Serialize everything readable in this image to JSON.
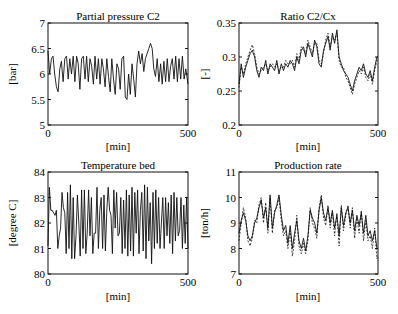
{
  "figure": {
    "width": 398,
    "height": 314,
    "line_color": "#111111",
    "background": "#ffffff"
  },
  "chart_data": [
    {
      "id": "partial-pressure",
      "type": "line",
      "title": "Partial pressure C2",
      "xlabel": "[min]",
      "ylabel": "[bar]",
      "xlim": [
        0,
        500
      ],
      "ylim": [
        5,
        7
      ],
      "xticks": [
        0,
        500
      ],
      "xtick_labels": [
        "0",
        "500"
      ],
      "yticks": [
        5,
        5.5,
        6,
        6.5,
        7
      ],
      "ytick_labels": [
        "5",
        "5.5",
        "6",
        "6.5",
        "7"
      ],
      "grid": false,
      "box": {
        "left": 48,
        "top": 23,
        "right": 188,
        "bottom": 125
      },
      "series": [
        {
          "name": "measured",
          "style": "solid",
          "x": [
            0,
            6,
            12,
            18,
            24,
            30,
            36,
            42,
            48,
            54,
            60,
            66,
            72,
            78,
            84,
            90,
            96,
            102,
            108,
            114,
            120,
            126,
            132,
            138,
            144,
            150,
            156,
            162,
            168,
            174,
            180,
            186,
            192,
            198,
            204,
            210,
            216,
            222,
            228,
            234,
            240,
            246,
            252,
            258,
            264,
            270,
            276,
            282,
            288,
            294,
            300,
            306,
            312,
            318,
            324,
            330,
            336,
            342,
            348,
            354,
            360,
            366,
            372,
            378,
            384,
            390,
            396,
            402,
            408,
            414,
            420,
            426,
            432,
            438,
            444,
            450,
            456,
            462,
            468,
            474,
            480,
            486,
            492,
            500
          ],
          "y": [
            6.45,
            6.0,
            6.3,
            6.35,
            6.0,
            5.75,
            5.65,
            6.1,
            6.25,
            5.85,
            6.3,
            6.35,
            5.9,
            6.3,
            6.0,
            6.35,
            5.85,
            6.35,
            6.2,
            5.7,
            6.3,
            6.35,
            5.9,
            6.35,
            5.85,
            6.3,
            6.15,
            5.8,
            6.35,
            5.9,
            6.3,
            5.8,
            6.3,
            6.1,
            5.75,
            6.3,
            5.95,
            5.65,
            6.3,
            5.9,
            5.6,
            6.2,
            6.1,
            5.7,
            6.3,
            6.35,
            5.55,
            5.5,
            6.0,
            5.6,
            6.2,
            5.9,
            5.55,
            6.2,
            6.45,
            6.2,
            6.4,
            6.05,
            6.3,
            6.4,
            6.5,
            6.6,
            6.5,
            6.1,
            5.95,
            6.3,
            5.85,
            6.2,
            5.8,
            6.25,
            5.85,
            6.3,
            5.85,
            6.15,
            6.3,
            5.9,
            6.35,
            5.85,
            6.3,
            5.9,
            6.35,
            5.9,
            6.1,
            5.8
          ]
        }
      ]
    },
    {
      "id": "ratio-c2-cx",
      "type": "line",
      "title": "Ratio C2/Cx",
      "xlabel": "[min]",
      "ylabel": "[-]",
      "xlim": [
        0,
        500
      ],
      "ylim": [
        0.2,
        0.35
      ],
      "xticks": [
        0,
        500
      ],
      "xtick_labels": [
        "0",
        "500"
      ],
      "yticks": [
        0.2,
        0.25,
        0.3,
        0.35
      ],
      "ytick_labels": [
        "0.2",
        "0.25",
        "0.3",
        "0.35"
      ],
      "grid": false,
      "box": {
        "left": 239,
        "top": 23,
        "right": 378,
        "bottom": 125
      },
      "series": [
        {
          "name": "measured",
          "style": "solid",
          "x": [
            0,
            8,
            16,
            24,
            32,
            40,
            48,
            56,
            64,
            72,
            80,
            88,
            96,
            104,
            112,
            120,
            128,
            136,
            144,
            152,
            160,
            168,
            176,
            184,
            192,
            200,
            208,
            216,
            224,
            232,
            240,
            248,
            256,
            264,
            272,
            280,
            288,
            296,
            304,
            312,
            320,
            328,
            336,
            344,
            352,
            360,
            368,
            376,
            384,
            392,
            400,
            408,
            416,
            424,
            432,
            440,
            448,
            456,
            464,
            472,
            480,
            488,
            496,
            500
          ],
          "y": [
            0.26,
            0.29,
            0.27,
            0.285,
            0.295,
            0.305,
            0.31,
            0.3,
            0.28,
            0.27,
            0.285,
            0.28,
            0.295,
            0.275,
            0.29,
            0.285,
            0.28,
            0.295,
            0.275,
            0.29,
            0.28,
            0.29,
            0.285,
            0.295,
            0.29,
            0.28,
            0.3,
            0.29,
            0.31,
            0.315,
            0.3,
            0.32,
            0.31,
            0.3,
            0.325,
            0.315,
            0.29,
            0.285,
            0.31,
            0.32,
            0.33,
            0.31,
            0.335,
            0.32,
            0.34,
            0.3,
            0.29,
            0.28,
            0.275,
            0.27,
            0.26,
            0.25,
            0.265,
            0.275,
            0.285,
            0.28,
            0.29,
            0.275,
            0.27,
            0.28,
            0.265,
            0.285,
            0.3,
            0.3
          ]
        },
        {
          "name": "model",
          "style": "dashed",
          "x": [
            0,
            8,
            16,
            24,
            32,
            40,
            48,
            56,
            64,
            72,
            80,
            88,
            96,
            104,
            112,
            120,
            128,
            136,
            144,
            152,
            160,
            168,
            176,
            184,
            192,
            200,
            208,
            216,
            224,
            232,
            240,
            248,
            256,
            264,
            272,
            280,
            288,
            296,
            304,
            312,
            320,
            328,
            336,
            344,
            352,
            360,
            368,
            376,
            384,
            392,
            400,
            408,
            416,
            424,
            432,
            440,
            448,
            456,
            464,
            472,
            480,
            488,
            496,
            500
          ],
          "y": [
            0.255,
            0.285,
            0.275,
            0.29,
            0.3,
            0.31,
            0.318,
            0.305,
            0.285,
            0.275,
            0.28,
            0.285,
            0.29,
            0.28,
            0.285,
            0.29,
            0.285,
            0.29,
            0.28,
            0.285,
            0.285,
            0.295,
            0.29,
            0.29,
            0.295,
            0.285,
            0.305,
            0.295,
            0.315,
            0.31,
            0.305,
            0.325,
            0.315,
            0.305,
            0.32,
            0.32,
            0.295,
            0.29,
            0.305,
            0.325,
            0.335,
            0.315,
            0.33,
            0.325,
            0.335,
            0.295,
            0.285,
            0.285,
            0.27,
            0.265,
            0.255,
            0.245,
            0.26,
            0.27,
            0.28,
            0.275,
            0.285,
            0.27,
            0.265,
            0.275,
            0.26,
            0.28,
            0.295,
            0.295
          ]
        }
      ]
    },
    {
      "id": "temperature-bed",
      "type": "line",
      "title": "Temperature bed",
      "xlabel": "[min]",
      "ylabel": "[degree C]",
      "xlim": [
        0,
        500
      ],
      "ylim": [
        80,
        84
      ],
      "xticks": [
        0,
        500
      ],
      "xtick_labels": [
        "0",
        "500"
      ],
      "yticks": [
        80,
        81,
        82,
        83,
        84
      ],
      "ytick_labels": [
        "80",
        "81",
        "82",
        "83",
        "84"
      ],
      "grid": false,
      "box": {
        "left": 48,
        "top": 172,
        "right": 188,
        "bottom": 274
      },
      "series": [
        {
          "name": "measured",
          "style": "solid",
          "x": [
            0,
            5,
            10,
            15,
            20,
            25,
            30,
            35,
            40,
            45,
            50,
            55,
            60,
            65,
            70,
            75,
            80,
            85,
            90,
            95,
            100,
            105,
            110,
            115,
            120,
            125,
            130,
            135,
            140,
            145,
            150,
            155,
            160,
            165,
            170,
            175,
            180,
            185,
            190,
            195,
            200,
            205,
            210,
            215,
            220,
            225,
            230,
            235,
            240,
            245,
            250,
            255,
            260,
            265,
            270,
            275,
            280,
            285,
            290,
            295,
            300,
            305,
            310,
            315,
            320,
            325,
            330,
            335,
            340,
            345,
            350,
            355,
            360,
            365,
            370,
            375,
            380,
            385,
            390,
            395,
            400,
            405,
            410,
            415,
            420,
            425,
            430,
            435,
            440,
            445,
            450,
            455,
            460,
            465,
            470,
            475,
            480,
            485,
            490,
            495,
            500
          ],
          "y": [
            81.1,
            83.4,
            82.5,
            82.5,
            82.4,
            82.3,
            82.5,
            81.0,
            81.5,
            81.8,
            83.2,
            82.6,
            82.4,
            80.8,
            83.2,
            81.0,
            83.5,
            80.6,
            83.0,
            80.6,
            81.5,
            83.1,
            82.0,
            80.7,
            83.3,
            81.0,
            83.3,
            80.8,
            81.6,
            83.3,
            81.5,
            83.0,
            80.8,
            81.6,
            81.6,
            83.4,
            81.0,
            82.5,
            83.0,
            81.0,
            83.1,
            80.9,
            82.5,
            83.4,
            82.5,
            82.3,
            80.8,
            83.3,
            81.8,
            83.2,
            81.5,
            81.6,
            83.0,
            80.8,
            82.9,
            81.0,
            83.3,
            80.7,
            83.1,
            80.9,
            83.4,
            80.7,
            83.2,
            81.6,
            83.3,
            80.8,
            82.5,
            83.2,
            80.9,
            83.5,
            80.6,
            83.4,
            81.3,
            82.8,
            80.4,
            83.2,
            81.0,
            83.3,
            81.2,
            83.0,
            81.0,
            82.0,
            83.0,
            81.0,
            83.0,
            81.5,
            82.8,
            81.2,
            83.1,
            80.8,
            83.2,
            81.3,
            83.0,
            81.5,
            81.7,
            83.0,
            81.0,
            82.7,
            81.2,
            83.0,
            81.0
          ]
        }
      ]
    },
    {
      "id": "production-rate",
      "type": "line",
      "title": "Production rate",
      "xlabel": "[min]",
      "ylabel": "[ton/h]",
      "xlim": [
        0,
        500
      ],
      "ylim": [
        7,
        11
      ],
      "xticks": [
        0,
        500
      ],
      "xtick_labels": [
        "0",
        "500"
      ],
      "yticks": [
        7,
        8,
        9,
        10,
        11
      ],
      "ytick_labels": [
        "7",
        "8",
        "9",
        "10",
        "11"
      ],
      "grid": false,
      "box": {
        "left": 239,
        "top": 172,
        "right": 378,
        "bottom": 274
      },
      "series": [
        {
          "name": "measured",
          "style": "solid",
          "x": [
            0,
            8,
            16,
            24,
            32,
            40,
            48,
            56,
            64,
            72,
            80,
            88,
            96,
            104,
            112,
            120,
            128,
            136,
            144,
            152,
            160,
            168,
            176,
            184,
            192,
            200,
            208,
            216,
            224,
            232,
            240,
            248,
            256,
            264,
            272,
            280,
            288,
            296,
            304,
            312,
            320,
            328,
            336,
            344,
            352,
            360,
            368,
            376,
            384,
            392,
            400,
            408,
            416,
            424,
            432,
            440,
            448,
            456,
            464,
            472,
            480,
            488,
            496,
            500
          ],
          "y": [
            8.6,
            9.1,
            9.4,
            9.1,
            8.5,
            8.3,
            8.5,
            9.0,
            9.2,
            9.6,
            9.9,
            9.2,
            9.6,
            8.8,
            10.1,
            8.8,
            9.4,
            9.7,
            10.1,
            9.3,
            8.7,
            8.9,
            8.2,
            8.9,
            8.0,
            8.6,
            9.1,
            8.3,
            8.0,
            8.4,
            7.9,
            8.5,
            9.5,
            9.2,
            9.0,
            8.6,
            9.5,
            10.0,
            9.4,
            9.1,
            9.6,
            9.0,
            9.5,
            8.8,
            9.3,
            8.5,
            9.6,
            8.9,
            9.4,
            9.6,
            9.0,
            9.5,
            8.7,
            9.3,
            8.9,
            9.4,
            8.6,
            9.3,
            8.5,
            8.7,
            8.3,
            8.7,
            8.0,
            8.0
          ]
        },
        {
          "name": "model",
          "style": "dashed",
          "x": [
            0,
            8,
            16,
            24,
            32,
            40,
            48,
            56,
            64,
            72,
            80,
            88,
            96,
            104,
            112,
            120,
            128,
            136,
            144,
            152,
            160,
            168,
            176,
            184,
            192,
            200,
            208,
            216,
            224,
            232,
            240,
            248,
            256,
            264,
            272,
            280,
            288,
            296,
            304,
            312,
            320,
            328,
            336,
            344,
            352,
            360,
            368,
            376,
            384,
            392,
            400,
            408,
            416,
            424,
            432,
            440,
            448,
            456,
            464,
            472,
            480,
            488,
            496,
            500
          ],
          "y": [
            8.3,
            9.0,
            9.6,
            9.2,
            8.3,
            8.1,
            8.4,
            9.1,
            9.0,
            9.7,
            10.0,
            9.0,
            9.8,
            8.6,
            10.0,
            8.6,
            9.5,
            9.6,
            10.0,
            9.1,
            8.5,
            8.7,
            8.0,
            8.7,
            7.7,
            8.3,
            9.3,
            8.1,
            7.8,
            8.2,
            7.8,
            8.3,
            9.6,
            9.0,
            8.8,
            8.4,
            9.6,
            10.1,
            9.2,
            8.9,
            9.7,
            8.8,
            9.4,
            8.5,
            9.4,
            8.1,
            9.7,
            8.7,
            9.3,
            9.7,
            8.8,
            9.6,
            8.4,
            9.2,
            8.6,
            9.5,
            8.3,
            9.1,
            8.3,
            8.5,
            8.0,
            8.8,
            7.6,
            7.7
          ]
        }
      ]
    }
  ]
}
